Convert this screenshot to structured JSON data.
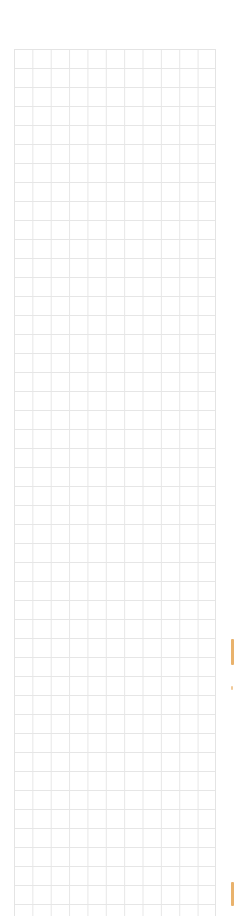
{
  "header": {
    "ghost_text": ""
  },
  "grid": {
    "columns": 11,
    "rows": 46,
    "cell_width_px": 18.4,
    "cell_height_px": 19,
    "line_color": "#e6e6e6",
    "cells_empty": true
  },
  "scroll_markers": {
    "color": "#e9b26c",
    "items": [
      {
        "name": "marker-top",
        "y": 639,
        "height": 26
      },
      {
        "name": "marker-dot",
        "y": 686,
        "height": 4
      },
      {
        "name": "marker-bottom",
        "y": 882,
        "height": 24
      }
    ]
  }
}
